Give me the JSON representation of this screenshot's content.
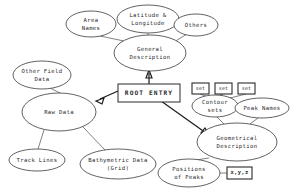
{
  "diagram": {
    "background_color": "#ffffff",
    "line_color": "#4a4a4a",
    "text_color": "#2a2a2a",
    "nodes": {
      "area_names": {
        "label": "Area Names",
        "lines": [
          "Area",
          "Names"
        ],
        "shape": "ellipse",
        "cx": 91,
        "cy": 24,
        "rx": 25,
        "ry": 13
      },
      "lat_long": {
        "label": "Latitude & Longitude",
        "lines": [
          "Latitude &",
          "Longitude"
        ],
        "shape": "ellipse",
        "cx": 148,
        "cy": 19,
        "rx": 31,
        "ry": 14
      },
      "others": {
        "label": "Others",
        "lines": [
          "Others"
        ],
        "shape": "ellipse",
        "cx": 196,
        "cy": 25,
        "rx": 22,
        "ry": 11
      },
      "general_desc": {
        "label": "General Description",
        "lines": [
          "General",
          "Description"
        ],
        "shape": "ellipse",
        "cx": 150,
        "cy": 53,
        "rx": 36,
        "ry": 18
      },
      "root_entry": {
        "label": "ROOT ENTRY",
        "lines": [
          "ROOT ENTRY"
        ],
        "shape": "rect",
        "x": 118,
        "y": 84,
        "w": 62,
        "h": 18
      },
      "other_field": {
        "label": "Other Field Data",
        "lines": [
          "Other Field",
          "Data"
        ],
        "shape": "ellipse",
        "cx": 42,
        "cy": 75,
        "rx": 29,
        "ry": 14
      },
      "raw_data": {
        "label": "Raw Data",
        "lines": [
          "Raw Data"
        ],
        "shape": "ellipse",
        "cx": 59,
        "cy": 112,
        "rx": 37,
        "ry": 19
      },
      "track_lines": {
        "label": "Track Lines",
        "lines": [
          "Track Lines"
        ],
        "shape": "ellipse",
        "cx": 37,
        "cy": 160,
        "rx": 28,
        "ry": 11
      },
      "bathymetric": {
        "label": "Bathymetric Data (Grid)",
        "lines": [
          "Bathymetric Data",
          "(Grid)"
        ],
        "shape": "ellipse",
        "cx": 118,
        "cy": 164,
        "rx": 38,
        "ry": 15
      },
      "geometrical": {
        "label": "Geometrical Description",
        "lines": [
          "Geometrical",
          "Description"
        ],
        "shape": "ellipse",
        "cx": 237,
        "cy": 142,
        "rx": 40,
        "ry": 19
      },
      "contour_sets": {
        "label": "Contour sets",
        "lines": [
          "Contour",
          "sets"
        ],
        "shape": "ellipse",
        "cx": 215,
        "cy": 106,
        "rx": 23,
        "ry": 11
      },
      "peak_names": {
        "label": "Peak Names",
        "lines": [
          "Peak Names"
        ],
        "shape": "ellipse",
        "cx": 262,
        "cy": 108,
        "rx": 27,
        "ry": 10
      },
      "positions_peaks": {
        "label": "Positions of Peaks",
        "lines": [
          "Positions",
          "of Peaks"
        ],
        "shape": "ellipse",
        "cx": 189,
        "cy": 173,
        "rx": 31,
        "ry": 14
      },
      "set_box_1": {
        "label": "set",
        "lines": [
          "set"
        ],
        "shape": "rect",
        "x": 192,
        "y": 83,
        "w": 17,
        "h": 11
      },
      "set_box_2": {
        "label": "set",
        "lines": [
          "set"
        ],
        "shape": "rect",
        "x": 215,
        "y": 83,
        "w": 17,
        "h": 11
      },
      "set_box_3": {
        "label": "set",
        "lines": [
          "set"
        ],
        "shape": "rect",
        "x": 238,
        "y": 83,
        "w": 17,
        "h": 11
      },
      "xyz_box": {
        "label": "x,y,z",
        "lines": [
          "x,y,z"
        ],
        "shape": "rect",
        "x": 227,
        "y": 167,
        "w": 25,
        "h": 12
      }
    },
    "arrows": [
      {
        "name": "root-to-general-description",
        "from": "root_entry",
        "to": "general_desc",
        "path": "M 149 84 L 149 73",
        "head": "M 149 70 L 146 78 L 152 78 Z"
      },
      {
        "name": "root-to-raw-data",
        "from": "root_entry",
        "to": "raw_data",
        "path": "M 118 91 L 100 99",
        "head": "M 96 101 L 104 98 L 102 104 Z"
      },
      {
        "name": "root-to-geometrical",
        "from": "root_entry",
        "to": "geometrical",
        "path": "M 161 101 L 206 133",
        "head": "M 210 136 L 201 133 L 205 128 Z"
      }
    ],
    "connectors": [
      {
        "name": "area-names-to-general-description",
        "path": "M 100 36 L 124 41"
      },
      {
        "name": "latitude-longitude-to-general",
        "path": "M 148 33 L 148 36"
      },
      {
        "name": "others-to-general-description",
        "path": "M 187 34 L 174 42"
      },
      {
        "name": "other-field-data-to-raw-data",
        "path": "M 50 88 L 62 94"
      },
      {
        "name": "raw-data-to-track-lines",
        "path": "M 44 130 L 38 149"
      },
      {
        "name": "raw-data-to-bathymetric",
        "path": "M 83 127 L 105 150"
      },
      {
        "name": "set-1-to-contour-sets",
        "path": "M 200 94 L 208 97"
      },
      {
        "name": "set-2-to-contour-sets",
        "path": "M 223 94 L 218 96"
      },
      {
        "name": "set-3-to-contour-sets",
        "path": "M 246 94 L 226 99"
      },
      {
        "name": "contour-sets-to-geometrical",
        "path": "M 217 117 L 224 124"
      },
      {
        "name": "peak-names-to-geometrical",
        "path": "M 258 118 L 250 124"
      },
      {
        "name": "geometrical-to-positions-of-peaks",
        "path": "M 209 158 L 196 160"
      },
      {
        "name": "positions-of-peaks-to-xyz",
        "path": "M 220 173 L 227 173"
      }
    ]
  }
}
